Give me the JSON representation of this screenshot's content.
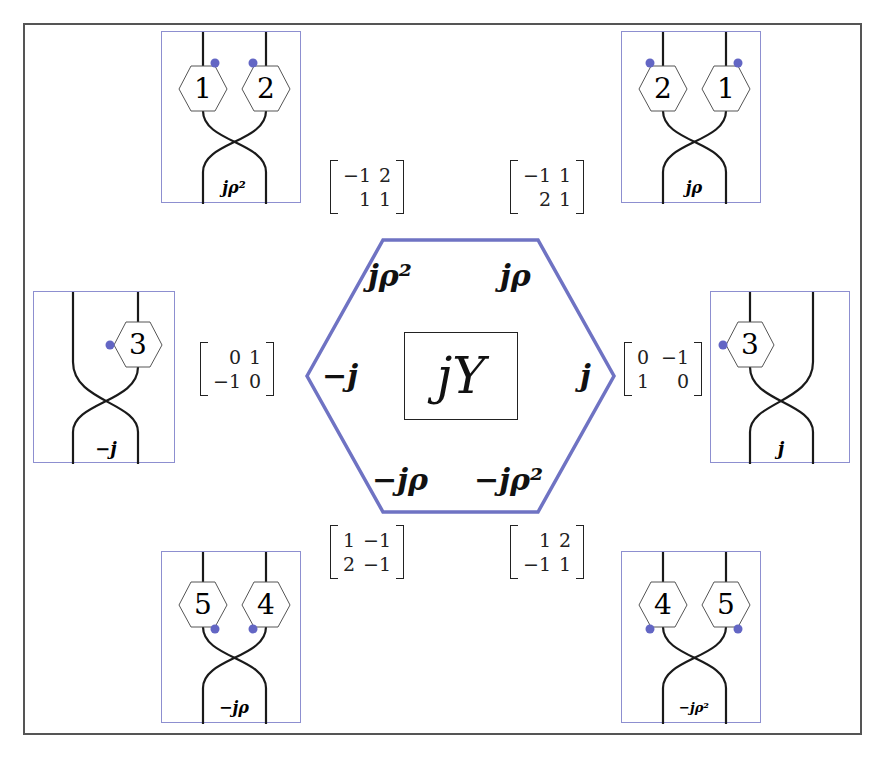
{
  "diagram": {
    "center": {
      "label": "jY",
      "hexagon_color": "#6f73c3",
      "edge_labels": {
        "top_left": "jρ²",
        "top_right": "jρ",
        "right": "j",
        "bottom_right": "−jρ²",
        "bottom_left": "−jρ",
        "left": "−j"
      }
    },
    "matrices": {
      "top_left": {
        "rows": [
          [
            "−1",
            "2"
          ],
          [
            "1",
            "1"
          ]
        ]
      },
      "top_right": {
        "rows": [
          [
            "−1",
            "1"
          ],
          [
            "2",
            "1"
          ]
        ]
      },
      "left": {
        "rows": [
          [
            "0",
            "1"
          ],
          [
            "−1",
            "0"
          ]
        ]
      },
      "right": {
        "rows": [
          [
            "0",
            "−1"
          ],
          [
            "1",
            "0"
          ]
        ]
      },
      "bottom_left": {
        "rows": [
          [
            "1",
            "−1"
          ],
          [
            "2",
            "−1"
          ]
        ]
      },
      "bottom_right": {
        "rows": [
          [
            "1",
            "2"
          ],
          [
            "−1",
            "1"
          ]
        ]
      }
    },
    "panels": {
      "top_left": {
        "hex_labels": [
          "1",
          "2"
        ],
        "crossing_label": "jρ²"
      },
      "top_right": {
        "hex_labels": [
          "2",
          "1"
        ],
        "crossing_label": "jρ"
      },
      "middle_left": {
        "hex_labels": [
          "3"
        ],
        "crossing_label": "−j"
      },
      "middle_right": {
        "hex_labels": [
          "3"
        ],
        "crossing_label": "j"
      },
      "bottom_left": {
        "hex_labels": [
          "5",
          "4"
        ],
        "crossing_label": "−jρ"
      },
      "bottom_right": {
        "hex_labels": [
          "4",
          "5"
        ],
        "crossing_label": "−jρ²"
      }
    },
    "colors": {
      "frame": "#555555",
      "panel_border": "#8d8fd0",
      "dot": "#6366c4",
      "strand": "#1a1a1a"
    }
  }
}
